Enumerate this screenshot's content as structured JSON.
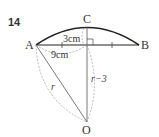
{
  "problem_number": "14",
  "points": {
    "A": "A",
    "B": "B",
    "C": "C",
    "O": "O"
  },
  "labels": {
    "height": "3cm",
    "half_chord": "9cm",
    "radius": "r",
    "r_minus_3": "r−3"
  },
  "colors": {
    "stroke": "#222222",
    "dashed": "#999999",
    "text": "#333333"
  }
}
